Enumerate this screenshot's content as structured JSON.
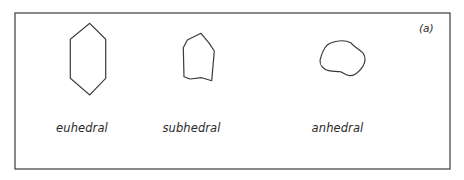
{
  "figure": {
    "panel_tag": "(a)",
    "frame": {
      "x": 15,
      "y": 13,
      "width": 435,
      "height": 156,
      "stroke": "#4a4a4a"
    },
    "shape_stroke": "#3a3a3a",
    "crystals": [
      {
        "name": "euhedral",
        "label": "euhedral",
        "label_x": 82,
        "label_y": 121,
        "shape": "polygon",
        "points": "89.7,23.3 105.7,39.3 105.7,78.3 89.7,95 70.3,78.3 70.3,39.3"
      },
      {
        "name": "subhedral",
        "label": "subhedral",
        "label_x": 191.5,
        "label_y": 121,
        "shape": "polygon",
        "points": "201,33.3 209.3,43.3 214.3,51 211.7,80.7 201.7,77.7 190,79 184,76.7 183.3,47.7 187.3,40"
      },
      {
        "name": "anhedral",
        "label": "anhedral",
        "label_x": 337.5,
        "label_y": 121,
        "shape": "path",
        "points": "M330,43.3 C337,40 346,40 350.7,42.7 C354,47 359,49 363.3,53.3 C366,58 365,63 362.7,66.7 C359,72 355,76 350,75.7 C345,75.5 343,72 340,71.7 C335,71 329,72 325,69.3 C320,66 319,61 321,56.7 C323,50 326,45 330,43.3 Z"
      }
    ]
  }
}
